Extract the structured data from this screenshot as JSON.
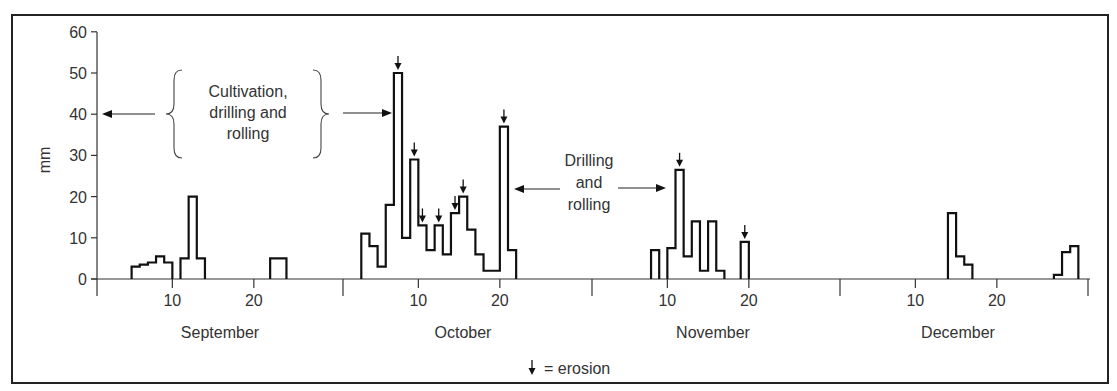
{
  "chart_data": {
    "type": "bar",
    "subtype": "step-histogram",
    "title": "",
    "xlabel": "",
    "ylabel": "mm",
    "ylim": [
      0,
      60
    ],
    "yticks": [
      0,
      10,
      20,
      30,
      40,
      50,
      60
    ],
    "months": [
      {
        "name": "September",
        "ticks": [
          10,
          20
        ]
      },
      {
        "name": "October",
        "ticks": [
          10,
          20
        ]
      },
      {
        "name": "November",
        "ticks": [
          10,
          20
        ]
      },
      {
        "name": "December",
        "ticks": [
          10,
          20
        ]
      }
    ],
    "series": [
      {
        "name": "Daily rainfall (mm)",
        "bars": [
          {
            "month": "September",
            "day": 5,
            "value": 3
          },
          {
            "month": "September",
            "day": 6,
            "value": 3.5
          },
          {
            "month": "September",
            "day": 7,
            "value": 4
          },
          {
            "month": "September",
            "day": 8,
            "value": 5.5
          },
          {
            "month": "September",
            "day": 9,
            "value": 4
          },
          {
            "month": "September",
            "day": 11,
            "value": 5
          },
          {
            "month": "September",
            "day": 12,
            "value": 20
          },
          {
            "month": "September",
            "day": 13,
            "value": 5
          },
          {
            "month": "September",
            "day": 22,
            "value": 5
          },
          {
            "month": "September",
            "day": 23,
            "value": 5
          },
          {
            "month": "October",
            "day": 3,
            "value": 11
          },
          {
            "month": "October",
            "day": 4,
            "value": 8
          },
          {
            "month": "October",
            "day": 5,
            "value": 3
          },
          {
            "month": "October",
            "day": 6,
            "value": 18
          },
          {
            "month": "October",
            "day": 7,
            "value": 50,
            "erosion": true
          },
          {
            "month": "October",
            "day": 8,
            "value": 10
          },
          {
            "month": "October",
            "day": 9,
            "value": 29,
            "erosion": true
          },
          {
            "month": "October",
            "day": 10,
            "value": 13,
            "erosion": true
          },
          {
            "month": "October",
            "day": 11,
            "value": 7
          },
          {
            "month": "October",
            "day": 12,
            "value": 13,
            "erosion": true
          },
          {
            "month": "October",
            "day": 13,
            "value": 6
          },
          {
            "month": "October",
            "day": 14,
            "value": 16,
            "erosion": true
          },
          {
            "month": "October",
            "day": 15,
            "value": 20,
            "erosion": true
          },
          {
            "month": "October",
            "day": 16,
            "value": 12
          },
          {
            "month": "October",
            "day": 17,
            "value": 6
          },
          {
            "month": "October",
            "day": 18,
            "value": 2
          },
          {
            "month": "October",
            "day": 19,
            "value": 2
          },
          {
            "month": "October",
            "day": 20,
            "value": 37,
            "erosion": true
          },
          {
            "month": "October",
            "day": 21,
            "value": 7
          },
          {
            "month": "November",
            "day": 8,
            "value": 7
          },
          {
            "month": "November",
            "day": 10,
            "value": 7.5
          },
          {
            "month": "November",
            "day": 11,
            "value": 26.5,
            "erosion": true
          },
          {
            "month": "November",
            "day": 12,
            "value": 5.5
          },
          {
            "month": "November",
            "day": 13,
            "value": 14
          },
          {
            "month": "November",
            "day": 14,
            "value": 2
          },
          {
            "month": "November",
            "day": 15,
            "value": 14
          },
          {
            "month": "November",
            "day": 16,
            "value": 2
          },
          {
            "month": "November",
            "day": 19,
            "value": 9,
            "erosion": true
          },
          {
            "month": "December",
            "day": 14,
            "value": 16
          },
          {
            "month": "December",
            "day": 15,
            "value": 5.5
          },
          {
            "month": "December",
            "day": 16,
            "value": 3.5
          },
          {
            "month": "December",
            "day": 27,
            "value": 1
          },
          {
            "month": "December",
            "day": 28,
            "value": 6.5
          },
          {
            "month": "December",
            "day": 29,
            "value": 8
          }
        ]
      }
    ],
    "annotations": [
      {
        "text": "Cultivation, drilling and rolling",
        "type": "bracket-with-arrows",
        "points_to": [
          "y-axis (start)",
          "October 7"
        ]
      },
      {
        "text": "Drilling and rolling",
        "type": "double-arrow",
        "span": [
          "October 20",
          "November 11"
        ]
      }
    ],
    "legend": {
      "symbol": "↓",
      "label": "= erosion",
      "position": "bottom-center"
    },
    "grid": false
  },
  "labels": {
    "y_axis": "mm",
    "annotation_1": [
      "Cultivation,",
      "drilling and",
      "rolling"
    ],
    "annotation_2": [
      "Drilling",
      "and",
      "rolling"
    ],
    "legend_text": "= erosion",
    "months": [
      "September",
      "October",
      "November",
      "December"
    ]
  }
}
